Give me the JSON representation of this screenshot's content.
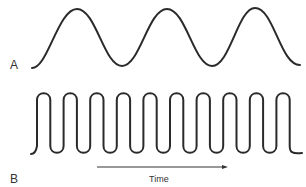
{
  "figure": {
    "panels": [
      {
        "id": "A",
        "label": "A",
        "description": "Low-frequency sinusoidal wave, 3 full cycles",
        "cycles": 3
      },
      {
        "id": "B",
        "label": "B",
        "description": "High-frequency wave with steep rises and falls, 10 pulses",
        "cycles": 10
      }
    ],
    "axis": {
      "label": "Time",
      "direction": "left-to-right arrow"
    },
    "colors": {
      "line": "#2a2a2a",
      "text": "#333333",
      "background": "#ffffff"
    }
  }
}
